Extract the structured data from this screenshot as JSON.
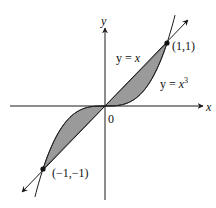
{
  "diagram": {
    "type": "function-area-plot",
    "axes": {
      "x_label": "x",
      "y_label": "y",
      "origin_label": "0"
    },
    "curves": [
      {
        "name": "line",
        "equation_lhs": "y = ",
        "equation_rhs": "x",
        "label": "y = x"
      },
      {
        "name": "cubic",
        "equation_lhs": "y = ",
        "equation_base": "x",
        "equation_exp": "3",
        "label": "y = x^3"
      }
    ],
    "points": [
      {
        "label": "(1,1)",
        "x": 1,
        "y": 1
      },
      {
        "label": "(−1,−1)",
        "x": -1,
        "y": -1
      }
    ],
    "shaded_region": {
      "description": "Region between y = x and y = x^3 on [-1, 1]",
      "fill": "#999999"
    },
    "colors": {
      "stroke": "#1a1a1a",
      "fill": "#9a9a9a",
      "background": "#ffffff"
    }
  }
}
